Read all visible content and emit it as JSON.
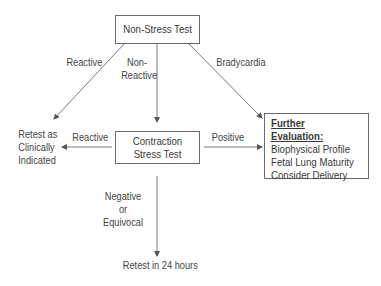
{
  "nodes": {
    "non_stress_test": "Non-Stress Test",
    "contraction_stress_test": [
      "Contraction",
      "Stress Test"
    ],
    "further_evaluation": {
      "heading": "Further Evaluation:",
      "items": [
        "Biophysical Profile",
        "Fetal Lung Maturity",
        "Consider Delivery"
      ]
    },
    "retest_clinically": [
      "Retest as",
      "Clinically",
      "Indicated"
    ],
    "retest_24": "Retest in 24 hours"
  },
  "edges": {
    "nst_reactive": "Reactive",
    "nst_non_reactive": [
      "Non-",
      "Reactive"
    ],
    "nst_bradycardia": "Bradycardia",
    "cst_reactive": "Reactive",
    "cst_positive": "Positive",
    "cst_negative": [
      "Negative",
      "or",
      "Equivocal"
    ]
  },
  "colors": {
    "line": "#6a6a6a",
    "text": "#3a3a3a"
  }
}
